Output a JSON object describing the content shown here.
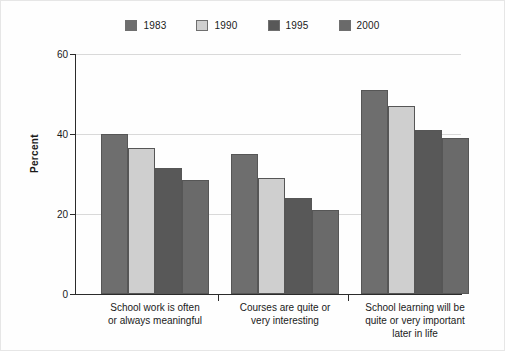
{
  "chart_data": {
    "type": "bar",
    "title": "",
    "xlabel": "",
    "ylabel": "Percent",
    "ylim": [
      0,
      60
    ],
    "yticks": [
      0,
      20,
      40,
      60
    ],
    "grid": true,
    "legend_position": "top-center",
    "categories": [
      "School work is often or always meaningful",
      "Courses are quite or very interesting",
      "School learning will be quite or very important later in life"
    ],
    "category_lines": [
      [
        "School work is often",
        "or always meaningful"
      ],
      [
        "Courses are quite or",
        "very interesting"
      ],
      [
        "School learning will be",
        "quite or very important",
        "later in life"
      ]
    ],
    "series": [
      {
        "name": "1983",
        "color": "#6e6e6e",
        "values": [
          40.0,
          35.0,
          51.0
        ]
      },
      {
        "name": "1990",
        "color": "#cfcfcf",
        "values": [
          36.5,
          29.0,
          47.0
        ]
      },
      {
        "name": "1995",
        "color": "#585858",
        "values": [
          31.5,
          24.0,
          41.0
        ]
      },
      {
        "name": "2000",
        "color": "#6a6a6a",
        "values": [
          28.5,
          21.0,
          39.0
        ]
      }
    ]
  },
  "legend": {
    "items": [
      {
        "label": "1983",
        "color": "#6e6e6e"
      },
      {
        "label": "1990",
        "color": "#cfcfcf"
      },
      {
        "label": "1995",
        "color": "#585858"
      },
      {
        "label": "2000",
        "color": "#6a6a6a"
      }
    ]
  },
  "axis": {
    "y_label": "Percent",
    "y_ticks": [
      "0",
      "20",
      "40",
      "60"
    ]
  }
}
